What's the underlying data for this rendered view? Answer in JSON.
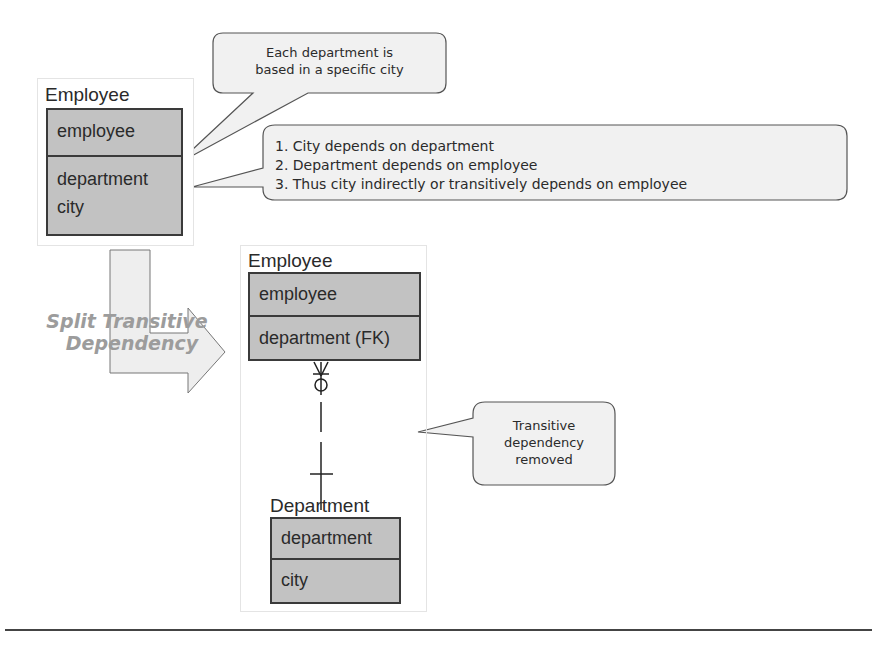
{
  "diagram": {
    "before": {
      "entity_name": "Employee",
      "key_attributes": [
        "employee"
      ],
      "attributes": [
        "department",
        "city"
      ]
    },
    "callouts": {
      "city_note": {
        "lines": [
          "Each department is",
          "based in a specific city"
        ]
      },
      "dependency_note": {
        "lines": [
          "1. City depends on department",
          "2. Department depends on employee",
          "3. Thus city indirectly or transitively depends on employee"
        ]
      },
      "removed_note": {
        "lines": [
          "Transitive",
          "dependency",
          "removed"
        ]
      }
    },
    "transform_arrow": {
      "label_lines": [
        "Split Transitive",
        "Dependency"
      ]
    },
    "after": {
      "employee": {
        "entity_name": "Employee",
        "key_attributes": [
          "employee"
        ],
        "attributes": [
          "department (FK)"
        ]
      },
      "department": {
        "entity_name": "Department",
        "key_attributes": [
          "department"
        ],
        "attributes": [
          "city"
        ]
      },
      "relationship": {
        "from": "Employee",
        "to": "Department",
        "from_cardinality": "zero-or-many",
        "to_cardinality": "exactly-one"
      }
    },
    "colors": {
      "entity_fill": "#c2c2c2",
      "entity_border": "#3a3a3a",
      "callout_fill": "#f1f1f1",
      "callout_border": "#555555",
      "arrow_fill": "#eeeeee",
      "label_gray": "#9c9c9c"
    }
  }
}
